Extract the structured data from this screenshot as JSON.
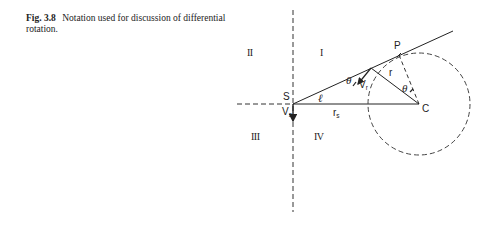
{
  "caption": {
    "figure_label": "Fig. 3.8",
    "text": "Notation used for discussion of differential rotation."
  },
  "diagram": {
    "quadrants": [
      "I",
      "II",
      "III",
      "IV"
    ],
    "points": {
      "S": "S",
      "P": "P",
      "C": "C"
    },
    "labels": {
      "l": "ℓ",
      "r": "r",
      "rs": "r",
      "rs_sub": "s",
      "Vs": "V",
      "Vs_sub": "s",
      "Vr": "V",
      "Vr_sub": "r",
      "theta1": "θ",
      "theta2": "θ"
    },
    "colors": {
      "ink": "#222222"
    }
  }
}
